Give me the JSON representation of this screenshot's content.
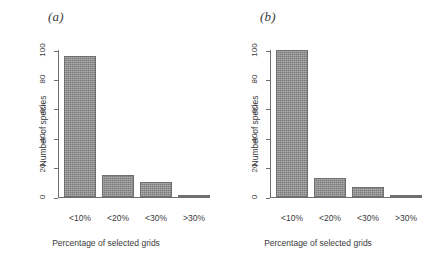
{
  "figure": {
    "background_color": "#ffffff",
    "bar_color": "#8d8d8d",
    "bar_edge_color": "#6f6f6f",
    "axis_color": "#6e6e6e"
  },
  "chart_data": [
    {
      "type": "bar",
      "panel_label": "(a)",
      "title": "",
      "categories": [
        "<10%",
        "<20%",
        "<30%",
        ">30%"
      ],
      "values": [
        96,
        15,
        10,
        1
      ],
      "xlabel": "Percentage of selected grids",
      "ylabel": "Number of species",
      "ylim": [
        0,
        100
      ],
      "yticks": [
        0,
        20,
        40,
        60,
        80,
        100
      ],
      "ytick_labels": [
        "0",
        "20",
        "40",
        "60",
        "80",
        "100"
      ],
      "grid": false,
      "legend": "none"
    },
    {
      "type": "bar",
      "panel_label": "(b)",
      "title": "",
      "categories": [
        "<10%",
        "<20%",
        "<30%",
        ">30%"
      ],
      "values": [
        100,
        13,
        7,
        1
      ],
      "xlabel": "Percentage of selected grids",
      "ylabel": "Number of species",
      "ylim": [
        0,
        100
      ],
      "yticks": [
        0,
        20,
        40,
        60,
        80,
        100
      ],
      "ytick_labels": [
        "0",
        "20",
        "40",
        "60",
        "80",
        "100"
      ],
      "grid": false,
      "legend": "none"
    }
  ]
}
